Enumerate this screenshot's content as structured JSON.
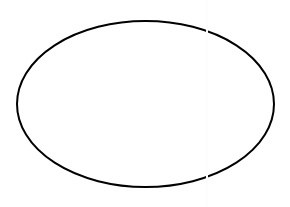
{
  "canvas": {
    "width": 290,
    "height": 207,
    "background_color": "#ffffff",
    "title": "",
    "caption": ""
  },
  "figure": {
    "kind": "ellipse-outline",
    "name": "ellipse",
    "label": "",
    "stroke_color": "#000000",
    "fill_color": "none",
    "stroke_width": 2,
    "center_x": 145.5,
    "center_y": 104,
    "radius_x": 128.5,
    "radius_y": 83,
    "bounds": {
      "left": 17,
      "top": 21,
      "right": 274,
      "bottom": 187
    }
  },
  "artifact": {
    "name": "vertical-seam",
    "x": 206,
    "color": "#fcfcfc",
    "visible": true
  },
  "annotations": [],
  "chart_data": {
    "type": "diagram",
    "title": "",
    "shapes": [
      {
        "type": "ellipse",
        "cx": 145.5,
        "cy": 104,
        "rx": 128.5,
        "ry": 83,
        "stroke": "#000000",
        "stroke_width": 2,
        "fill": "none",
        "label": ""
      }
    ],
    "xlabel": "",
    "ylabel": "",
    "legend": []
  }
}
